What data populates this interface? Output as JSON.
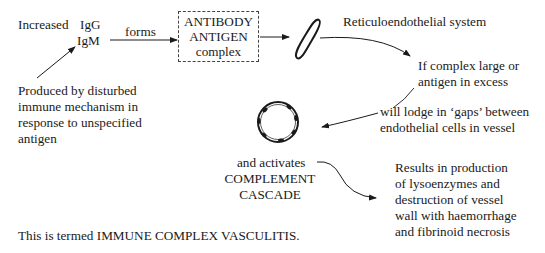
{
  "diagram": {
    "increased_label": "Increased",
    "ig_types": [
      "IgG",
      "IgM"
    ],
    "forms_label": "forms",
    "complex_box": [
      "ANTIBODY",
      "ANTIGEN",
      "complex"
    ],
    "re_system_label": "Reticuloendothelial system",
    "condition_label": [
      "If complex large or",
      "antigen in excess"
    ],
    "lodge_label": [
      "will lodge in ‘gaps’ between",
      "endothelial cells in vessel"
    ],
    "produced_label": [
      "Produced by disturbed",
      "immune mechanism in",
      "response to unspecified",
      "antigen"
    ],
    "activates_label": [
      "and activates",
      "COMPLEMENT",
      "CASCADE"
    ],
    "results_label": [
      "Results in production",
      "of lysoenzymes and",
      "destruction of vessel",
      "wall with haemorrhage",
      "and fibrinoid necrosis"
    ],
    "conclusion": "This is termed IMMUNE COMPLEX VASCULITIS.",
    "icons": [
      "re-cell-icon",
      "vessel-cross-section-icon"
    ],
    "colors": {
      "ink": "#1a1a1a",
      "background": "#ffffff"
    }
  }
}
